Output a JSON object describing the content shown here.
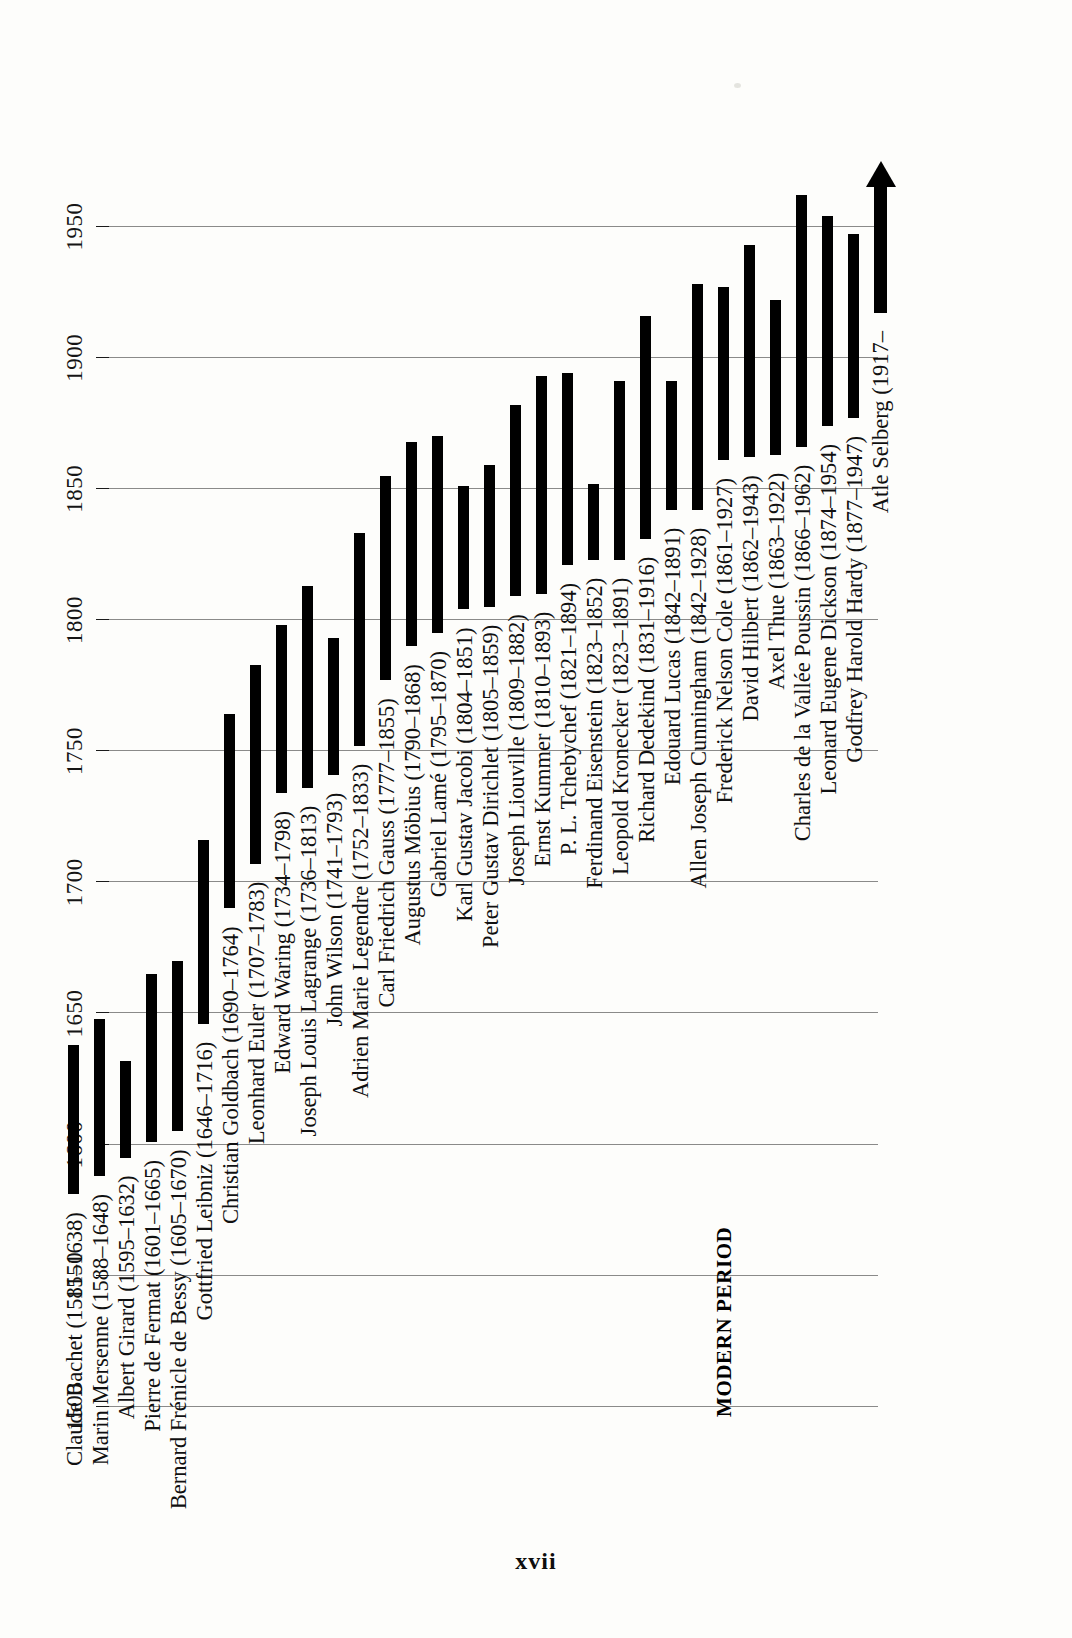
{
  "page": {
    "folio": "xvii",
    "era_label": "MODERN PERIOD"
  },
  "chart_data": {
    "type": "bar",
    "orientation": "horizontal-rotated",
    "title": "",
    "subtitle": "",
    "xlabel": "",
    "ylabel": "",
    "axis_label": "Year",
    "xlim": [
      1490,
      1975
    ],
    "ticks": [
      1500,
      1550,
      1600,
      1650,
      1700,
      1750,
      1800,
      1850,
      1900,
      1950
    ],
    "tick_labels": [
      "1500",
      "1550",
      "1600",
      "1650",
      "1700",
      "1750",
      "1800",
      "1850",
      "1900",
      "1950"
    ],
    "grid": true,
    "legend": "none",
    "bar_color": "#000000",
    "categories": [
      "Claude Bachet",
      "Marin Mersenne",
      "Albert Girard",
      "Pierre de Fermat",
      "Bernard Frénicle de Bessy",
      "Gottfried Leibniz",
      "Christian Goldbach",
      "Leonhard Euler",
      "Edward Waring",
      "Joseph Louis Lagrange",
      "John Wilson",
      "Adrien Marie Legendre",
      "Carl Friedrich Gauss",
      "Augustus Möbius",
      "Gabriel Lamé",
      "Karl Gustav Jacobi",
      "Peter Gustav Dirichlet",
      "Joseph Liouville",
      "Ernst Kummer",
      "P. L. Tchebychef",
      "Ferdinand Eisenstein",
      "Leopold Kronecker",
      "Richard Dedekind",
      "Edouard Lucas",
      "Allen Joseph Cunningham",
      "Frederick Nelson Cole",
      "David Hilbert",
      "Axel Thue",
      "Charles de la Vallée Poussin",
      "Leonard Eugene Dickson",
      "Godfrey Harold Hardy",
      "Atle Selberg"
    ],
    "labels": [
      "Claude Bachet (1581–1638)",
      "Marin Mersenne (1588–1648)",
      "Albert Girard (1595–1632)",
      "Pierre de Fermat (1601–1665)",
      "Bernard Frénicle de Bessy (1605–1670)",
      "Gottfried Leibniz (1646–1716)",
      "Christian Goldbach (1690–1764)",
      "Leonhard Euler (1707–1783)",
      "Edward Waring (1734–1798)",
      "Joseph Louis Lagrange (1736–1813)",
      "John Wilson (1741–1793)",
      "Adrien Marie Legendre (1752–1833)",
      "Carl Friedrich Gauss (1777–1855)",
      "Augustus Möbius (1790–1868)",
      "Gabriel Lamé (1795–1870)",
      "Karl Gustav Jacobi (1804–1851)",
      "Peter Gustav Dirichlet (1805–1859)",
      "Joseph Liouville (1809–1882)",
      "Ernst Kummer (1810–1893)",
      "P. L. Tchebychef (1821–1894)",
      "Ferdinand Eisenstein (1823–1852)",
      "Leopold Kronecker (1823–1891)",
      "Richard Dedekind (1831–1916)",
      "Edouard Lucas (1842–1891)",
      "Allen Joseph Cunningham (1842–1928)",
      "Frederick Nelson Cole (1861–1927)",
      "David Hilbert (1862–1943)",
      "Axel Thue (1863–1922)",
      "Charles de la Vallée Poussin (1866–1962)",
      "Leonard Eugene Dickson (1874–1954)",
      "Godfrey Harold Hardy (1877–1947)",
      "Atle Selberg (1917–"
    ],
    "spans": [
      {
        "name": "Claude Bachet",
        "birth": 1581,
        "death": 1638,
        "open_ended": false
      },
      {
        "name": "Marin Mersenne",
        "birth": 1588,
        "death": 1648,
        "open_ended": false
      },
      {
        "name": "Albert Girard",
        "birth": 1595,
        "death": 1632,
        "open_ended": false
      },
      {
        "name": "Pierre de Fermat",
        "birth": 1601,
        "death": 1665,
        "open_ended": false
      },
      {
        "name": "Bernard Frénicle de Bessy",
        "birth": 1605,
        "death": 1670,
        "open_ended": false
      },
      {
        "name": "Gottfried Leibniz",
        "birth": 1646,
        "death": 1716,
        "open_ended": false
      },
      {
        "name": "Christian Goldbach",
        "birth": 1690,
        "death": 1764,
        "open_ended": false
      },
      {
        "name": "Leonhard Euler",
        "birth": 1707,
        "death": 1783,
        "open_ended": false
      },
      {
        "name": "Edward Waring",
        "birth": 1734,
        "death": 1798,
        "open_ended": false
      },
      {
        "name": "Joseph Louis Lagrange",
        "birth": 1736,
        "death": 1813,
        "open_ended": false
      },
      {
        "name": "John Wilson",
        "birth": 1741,
        "death": 1793,
        "open_ended": false
      },
      {
        "name": "Adrien Marie Legendre",
        "birth": 1752,
        "death": 1833,
        "open_ended": false
      },
      {
        "name": "Carl Friedrich Gauss",
        "birth": 1777,
        "death": 1855,
        "open_ended": false
      },
      {
        "name": "Augustus Möbius",
        "birth": 1790,
        "death": 1868,
        "open_ended": false
      },
      {
        "name": "Gabriel Lamé",
        "birth": 1795,
        "death": 1870,
        "open_ended": false
      },
      {
        "name": "Karl Gustav Jacobi",
        "birth": 1804,
        "death": 1851,
        "open_ended": false
      },
      {
        "name": "Peter Gustav Dirichlet",
        "birth": 1805,
        "death": 1859,
        "open_ended": false
      },
      {
        "name": "Joseph Liouville",
        "birth": 1809,
        "death": 1882,
        "open_ended": false
      },
      {
        "name": "Ernst Kummer",
        "birth": 1810,
        "death": 1893,
        "open_ended": false
      },
      {
        "name": "P. L. Tchebychef",
        "birth": 1821,
        "death": 1894,
        "open_ended": false
      },
      {
        "name": "Ferdinand Eisenstein",
        "birth": 1823,
        "death": 1852,
        "open_ended": false
      },
      {
        "name": "Leopold Kronecker",
        "birth": 1823,
        "death": 1891,
        "open_ended": false
      },
      {
        "name": "Richard Dedekind",
        "birth": 1831,
        "death": 1916,
        "open_ended": false
      },
      {
        "name": "Edouard Lucas",
        "birth": 1842,
        "death": 1891,
        "open_ended": false
      },
      {
        "name": "Allen Joseph Cunningham",
        "birth": 1842,
        "death": 1928,
        "open_ended": false
      },
      {
        "name": "Frederick Nelson Cole",
        "birth": 1861,
        "death": 1927,
        "open_ended": false
      },
      {
        "name": "David Hilbert",
        "birth": 1862,
        "death": 1943,
        "open_ended": false
      },
      {
        "name": "Axel Thue",
        "birth": 1863,
        "death": 1922,
        "open_ended": false
      },
      {
        "name": "Charles de la Vallée Poussin",
        "birth": 1866,
        "death": 1962,
        "open_ended": false
      },
      {
        "name": "Leonard Eugene Dickson",
        "birth": 1874,
        "death": 1954,
        "open_ended": false
      },
      {
        "name": "Godfrey Harold Hardy",
        "birth": 1877,
        "death": 1947,
        "open_ended": false
      },
      {
        "name": "Atle Selberg",
        "birth": 1917,
        "death": 1975,
        "open_ended": true
      }
    ]
  }
}
